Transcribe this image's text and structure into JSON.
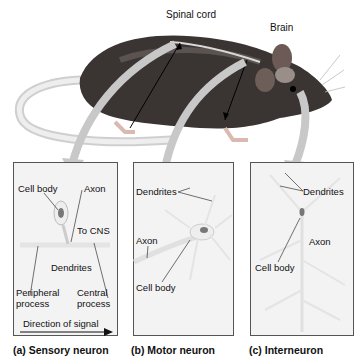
{
  "figure": {
    "top_labels": {
      "spinal_cord": "Spinal cord",
      "brain": "Brain"
    },
    "panels": [
      {
        "caption": "(a) Sensory neuron",
        "labels": {
          "cell_body": "Cell body",
          "axon": "Axon",
          "to_cns": "To CNS",
          "dendrites": "Dendrites",
          "peripheral_1": "Peripheral",
          "peripheral_2": "process",
          "central_1": "Central",
          "central_2": "process",
          "direction": "Direction of signal"
        }
      },
      {
        "caption": "(b) Motor neuron",
        "labels": {
          "dendrites": "Dendrites",
          "axon": "Axon",
          "cell_body": "Cell body"
        }
      },
      {
        "caption": "(c) Interneuron",
        "labels": {
          "dendrites": "Dendrites",
          "axon": "Axon",
          "cell_body": "Cell body"
        }
      }
    ]
  }
}
